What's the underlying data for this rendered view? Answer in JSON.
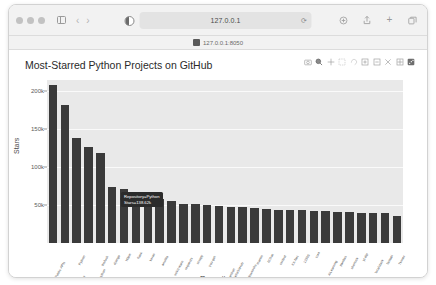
{
  "browser": {
    "traffic_lights": [
      "close",
      "minimize",
      "zoom"
    ],
    "sidebar_label": "Show Sidebar",
    "back_label": "‹",
    "forward_label": "›",
    "reader_label": "Reader",
    "address": "127.0.0.1",
    "reload_label": "⟳",
    "share_label": "Share",
    "upload_label": "Upload",
    "new_tab_label": "+",
    "tabs_label": "Tabs",
    "tab_title": "127.0.0.1:8050"
  },
  "chart_data": {
    "type": "bar",
    "title": "Most-Starred Python Projects on GitHub",
    "xlabel": "Repository",
    "ylabel": "Stars",
    "ylim": [
      0,
      215000
    ],
    "grid": true,
    "legend": "none",
    "ytick_labels": [
      "200k",
      "150k",
      "100k",
      "50k"
    ],
    "ytick_values": [
      200000,
      150000,
      100000,
      50000
    ],
    "bar_color": "#3a3a3a",
    "plot_bgcolor": "#e9e9e9",
    "categories": [
      "Public-APIs",
      "system-design-primer",
      "Python",
      "awesome-python",
      "thefuck",
      "django",
      "httpie",
      "flask",
      "keras",
      "ansible",
      "scikit-learn",
      "requests",
      "scrapy",
      "you-get",
      "face_recognition",
      "HelloGitHub",
      "shadowsocks",
      "manim",
      "ItChat",
      "certbot",
      "XX-Net",
      "12306",
      "core",
      "AiLearning",
      "pandas",
      "sherlock",
      "yt-dlp",
      "localstack",
      "fastapi",
      "Tkinter"
    ],
    "values": [
      208000,
      182000,
      138620,
      126000,
      119000,
      74000,
      71000,
      62000,
      61000,
      58000,
      56000,
      52000,
      51000,
      50000,
      49000,
      48000,
      47000,
      46000,
      45000,
      44000,
      43000,
      43000,
      42000,
      42000,
      41000,
      41000,
      40000,
      40000,
      39000,
      36000
    ]
  },
  "tooltip": {
    "category_line": "Repository=Python",
    "value_line": "Stars=138.62k"
  },
  "modebar": {
    "items": [
      "camera-icon",
      "zoom-icon",
      "pan-icon",
      "box-select-icon",
      "lasso-select-icon",
      "zoom-in-icon",
      "zoom-out-icon",
      "autoscale-icon",
      "reset-axes-icon",
      "plotly-logo-icon"
    ]
  }
}
